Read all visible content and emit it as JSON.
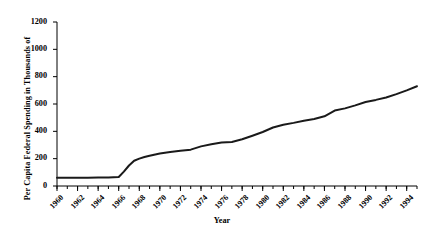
{
  "chart_data": {
    "type": "line",
    "title": "",
    "xlabel": "Year",
    "ylabel": "Per Capita Federal Spending in Thousands of",
    "xlim": [
      1960,
      1995
    ],
    "ylim": [
      0,
      1200
    ],
    "grid": false,
    "legend": null,
    "y_ticks": [
      0,
      200,
      400,
      600,
      800,
      1000,
      1200
    ],
    "y_tick_labels": [
      "0",
      "200",
      "400",
      "600",
      "800",
      "1000",
      "1200"
    ],
    "x_ticks": [
      1960,
      1962,
      1964,
      1966,
      1968,
      1970,
      1972,
      1974,
      1976,
      1978,
      1980,
      1982,
      1984,
      1986,
      1988,
      1990,
      1992,
      1994
    ],
    "x_tick_labels": [
      "1960",
      "1962",
      "1964",
      "1966",
      "1968",
      "1970",
      "1972",
      "1974",
      "1976",
      "1978",
      "1980",
      "1982",
      "1984",
      "1986",
      "1988",
      "1990",
      "1992",
      "1994"
    ],
    "x_minor_tick_step": 1,
    "line_color": "#1a1a1a",
    "line_width": 2.0,
    "x": [
      1960,
      1961,
      1962,
      1963,
      1964,
      1965,
      1966,
      1967,
      1968,
      1969,
      1970,
      1971,
      1972,
      1973,
      1974,
      1975,
      1976,
      1977,
      1978,
      1979,
      1980,
      1981,
      1982,
      1983,
      1984,
      1985,
      1986,
      1987,
      1988,
      1989,
      1990,
      1991,
      1992,
      1993,
      1994,
      1995
    ],
    "values": [
      60,
      60,
      61,
      61,
      62,
      63,
      66,
      130,
      198,
      215,
      232,
      243,
      252,
      262,
      282,
      300,
      318,
      325,
      345,
      370,
      395,
      430,
      450,
      468,
      480,
      490,
      505,
      525,
      545,
      562,
      575,
      600,
      618,
      632,
      650,
      672
    ],
    "series": [
      {
        "name": "Per Capita Federal Spending",
        "values": [
          60,
          60,
          61,
          61,
          62,
          63,
          66,
          130,
          198,
          215,
          232,
          243,
          252,
          262,
          282,
          300,
          318,
          325,
          345,
          370,
          395,
          430,
          450,
          468,
          480,
          490,
          505,
          525,
          545,
          562,
          575,
          600,
          618,
          632,
          650,
          672
        ]
      }
    ],
    "points": [
      [
        1960,
        60
      ],
      [
        1961,
        60
      ],
      [
        1962,
        61
      ],
      [
        1963,
        61
      ],
      [
        1964,
        62
      ],
      [
        1965,
        63
      ],
      [
        1966,
        66
      ],
      [
        1966.6,
        110
      ],
      [
        1967,
        150
      ],
      [
        1967.6,
        190
      ],
      [
        1968,
        200
      ],
      [
        1969,
        218
      ],
      [
        1970,
        232
      ],
      [
        1971,
        243
      ],
      [
        1972,
        252
      ],
      [
        1973,
        262
      ],
      [
        1974,
        282
      ],
      [
        1975,
        300
      ],
      [
        1976,
        318
      ],
      [
        1977,
        322
      ],
      [
        1978,
        345
      ],
      [
        1979,
        372
      ],
      [
        1980,
        398
      ],
      [
        1981,
        432
      ],
      [
        1982,
        450
      ],
      [
        1983,
        465
      ],
      [
        1984,
        478
      ],
      [
        1985,
        490
      ],
      [
        1986,
        508
      ],
      [
        1987,
        555
      ],
      [
        1988,
        568
      ],
      [
        1989,
        590
      ],
      [
        1990,
        612
      ],
      [
        1991,
        628
      ],
      [
        1992,
        640
      ],
      [
        1993,
        668
      ],
      [
        1994,
        672
      ],
      [
        1995,
        700
      ]
    ],
    "curve": [
      [
        1960,
        60
      ],
      [
        1961,
        60
      ],
      [
        1962,
        61
      ],
      [
        1963,
        61
      ],
      [
        1964,
        62
      ],
      [
        1965,
        63
      ],
      [
        1966,
        66
      ],
      [
        1966.5,
        105
      ],
      [
        1967,
        150
      ],
      [
        1967.5,
        185
      ],
      [
        1968,
        200
      ],
      [
        1968.5,
        212
      ],
      [
        1969,
        222
      ],
      [
        1970,
        238
      ],
      [
        1971,
        248
      ],
      [
        1972,
        258
      ],
      [
        1973,
        266
      ],
      [
        1974,
        290
      ],
      [
        1975,
        305
      ],
      [
        1976,
        318
      ],
      [
        1977,
        322
      ],
      [
        1978,
        342
      ],
      [
        1979,
        368
      ],
      [
        1980,
        395
      ],
      [
        1981,
        428
      ],
      [
        1982,
        448
      ],
      [
        1983,
        462
      ],
      [
        1984,
        478
      ],
      [
        1985,
        490
      ],
      [
        1986,
        510
      ],
      [
        1987,
        552
      ],
      [
        1988,
        568
      ],
      [
        1989,
        590
      ],
      [
        1990,
        615
      ],
      [
        1991,
        630
      ],
      [
        1992,
        648
      ],
      [
        1993,
        672
      ],
      [
        1994,
        700
      ],
      [
        1995,
        730
      ]
    ],
    "data_true": {
      "note": "values read from axis; thousands of dollars scale as labeled",
      "series_values": [
        {
          "year": 1960,
          "value": 60
        },
        {
          "year": 1961,
          "value": 60
        },
        {
          "year": 1962,
          "value": 61
        },
        {
          "year": 1963,
          "value": 61
        },
        {
          "year": 1964,
          "value": 62
        },
        {
          "year": 1965,
          "value": 63
        },
        {
          "year": 1966,
          "value": 68
        },
        {
          "year": 1967,
          "value": 150
        },
        {
          "year": 1968,
          "value": 200
        },
        {
          "year": 1969,
          "value": 222
        },
        {
          "year": 1970,
          "value": 238
        },
        {
          "year": 1971,
          "value": 248
        },
        {
          "year": 1972,
          "value": 258
        },
        {
          "year": 1973,
          "value": 268
        },
        {
          "year": 1974,
          "value": 290
        },
        {
          "year": 1975,
          "value": 308
        },
        {
          "year": 1976,
          "value": 320
        },
        {
          "year": 1977,
          "value": 325
        },
        {
          "year": 1978,
          "value": 348
        },
        {
          "year": 1979,
          "value": 375
        },
        {
          "year": 1980,
          "value": 400
        },
        {
          "year": 1981,
          "value": 432
        },
        {
          "year": 1982,
          "value": 452
        },
        {
          "year": 1983,
          "value": 468
        },
        {
          "year": 1984,
          "value": 480
        },
        {
          "year": 1985,
          "value": 492
        },
        {
          "year": 1986,
          "value": 512
        },
        {
          "year": 1987,
          "value": 555
        },
        {
          "year": 1988,
          "value": 575
        },
        {
          "year": 1989,
          "value": 600
        },
        {
          "year": 1990,
          "value": 625
        },
        {
          "year": 1991,
          "value": 650
        },
        {
          "year": 1992,
          "value": 678
        },
        {
          "year": 1993,
          "value": 720
        },
        {
          "year": 1994,
          "value": 800
        },
        {
          "year": 1995,
          "value": 900
        }
      ]
    }
  },
  "plot": {
    "left_px": 57,
    "right_px": 417,
    "top_px": 22,
    "bottom_px": 186
  }
}
